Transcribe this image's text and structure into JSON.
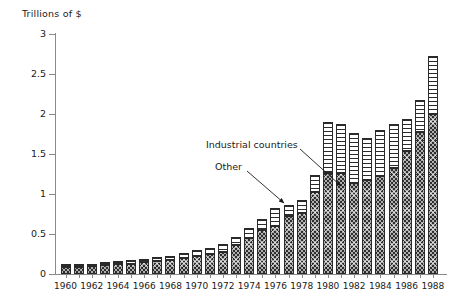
{
  "chart_data": {
    "type": "bar",
    "stacked": true,
    "title": "",
    "ylabel": "Trillions of $",
    "xlabel": "",
    "ylim": [
      0,
      3
    ],
    "yticks": [
      0,
      0.5,
      1,
      1.5,
      2,
      2.5,
      3
    ],
    "ytick_labels": [
      "0",
      "0.5",
      "1",
      "1.5",
      "2",
      "2.5",
      "3"
    ],
    "grid": false,
    "legend": "annotations",
    "x": [
      1960,
      1961,
      1962,
      1963,
      1964,
      1965,
      1966,
      1967,
      1968,
      1969,
      1970,
      1971,
      1972,
      1973,
      1974,
      1975,
      1976,
      1977,
      1978,
      1979,
      1980,
      1981,
      1982,
      1983,
      1984,
      1985,
      1986,
      1987,
      1988
    ],
    "xtick_labels": [
      "1960",
      "1962",
      "1964",
      "1966",
      "1968",
      "1970",
      "1972",
      "1974",
      "1976",
      "1978",
      "1980",
      "1982",
      "1984",
      "1986",
      "1988"
    ],
    "xticks": [
      1960,
      1962,
      1964,
      1966,
      1968,
      1970,
      1972,
      1974,
      1976,
      1978,
      1980,
      1982,
      1984,
      1986,
      1988
    ],
    "series": [
      {
        "name": "Industrial countries",
        "values": [
          0.09,
          0.09,
          0.1,
          0.11,
          0.12,
          0.13,
          0.15,
          0.16,
          0.18,
          0.2,
          0.23,
          0.25,
          0.28,
          0.36,
          0.45,
          0.55,
          0.6,
          0.72,
          0.76,
          1.02,
          1.26,
          1.26,
          1.14,
          1.18,
          1.23,
          1.32,
          1.54,
          1.78,
          2.0
        ]
      },
      {
        "name": "Other",
        "values": [
          0.03,
          0.03,
          0.03,
          0.04,
          0.04,
          0.04,
          0.04,
          0.05,
          0.05,
          0.06,
          0.07,
          0.08,
          0.09,
          0.1,
          0.12,
          0.14,
          0.22,
          0.14,
          0.16,
          0.22,
          0.64,
          0.62,
          0.62,
          0.52,
          0.57,
          0.55,
          0.4,
          0.4,
          0.72
        ]
      }
    ],
    "totals": [
      0.12,
      0.12,
      0.13,
      0.15,
      0.16,
      0.17,
      0.19,
      0.21,
      0.23,
      0.26,
      0.3,
      0.33,
      0.37,
      0.46,
      0.57,
      0.69,
      0.82,
      0.86,
      0.92,
      1.24,
      1.9,
      1.88,
      1.76,
      1.7,
      1.8,
      1.87,
      1.94,
      2.18,
      2.72
    ],
    "annotations": [
      {
        "text": "Industrial countries",
        "points_to": 1979
      },
      {
        "text": "Other",
        "points_to": 1976
      }
    ],
    "colors": {
      "industrial": "#2e2e2e",
      "other": "#ffffff",
      "axis": "#8a8a8a",
      "text": "#1a1a1a"
    }
  }
}
